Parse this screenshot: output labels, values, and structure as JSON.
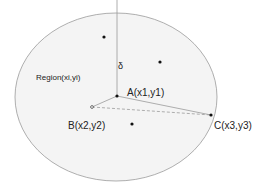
{
  "diagram": {
    "region": {
      "label": "Region(xi,yi)",
      "shape": "ellipse",
      "fill": "#f4f4f4",
      "stroke": "#9a9a9a"
    },
    "delta_label": "δ",
    "points": [
      {
        "id": "A",
        "label": "A(x1,y1)"
      },
      {
        "id": "B",
        "label": "B(x2,y2)"
      },
      {
        "id": "C",
        "label": "C(x3,y3)"
      }
    ],
    "edges": [
      {
        "from": "A",
        "to": "B",
        "style": "solid"
      },
      {
        "from": "A",
        "to": "C",
        "style": "solid"
      },
      {
        "from": "B",
        "to": "C",
        "style": "dashed"
      }
    ],
    "extra_points": 3,
    "line_color": "#9a9a9a",
    "point_color": "#111111"
  }
}
